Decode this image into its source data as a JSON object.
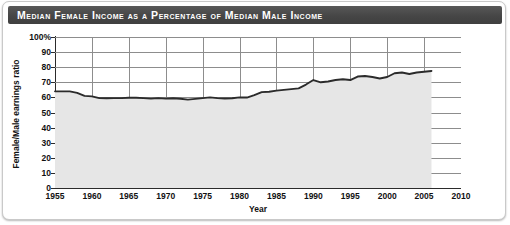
{
  "header": {
    "title": "Median Female Income as a Percentage of Median Male Income"
  },
  "chart_data": {
    "type": "area",
    "title": "Median Female Income as a Percentage of Median Male Income",
    "xlabel": "Year",
    "ylabel": "Female/Male earnings ratio",
    "xlim": [
      1955,
      2010
    ],
    "ylim": [
      0,
      100
    ],
    "grid": true,
    "legend": null,
    "xticks": [
      1955,
      1960,
      1965,
      1970,
      1975,
      1980,
      1985,
      1990,
      1995,
      2000,
      2005,
      2010
    ],
    "xtick_labels": [
      "1955",
      "1960",
      "1965",
      "1970",
      "1975",
      "1980",
      "1985",
      "1990",
      "1995",
      "2000",
      "2005",
      "2010"
    ],
    "yticks": [
      0,
      10,
      20,
      30,
      40,
      50,
      60,
      70,
      80,
      90,
      100
    ],
    "ytick_labels": [
      "0",
      "10",
      "20",
      "30",
      "40",
      "50",
      "60",
      "70",
      "80",
      "90",
      "100%"
    ],
    "line_color": "#2b2b2b",
    "fill_color": "#e6e6e6",
    "grid_color": "#8d8d8d",
    "series_name": "Female/Male earnings ratio",
    "x": [
      1955,
      1956,
      1957,
      1958,
      1959,
      1960,
      1961,
      1962,
      1963,
      1964,
      1965,
      1966,
      1967,
      1968,
      1969,
      1970,
      1971,
      1972,
      1973,
      1974,
      1975,
      1976,
      1977,
      1978,
      1979,
      1980,
      1981,
      1982,
      1983,
      1984,
      1985,
      1986,
      1987,
      1988,
      1989,
      1990,
      1991,
      1992,
      1993,
      1994,
      1995,
      1996,
      1997,
      1998,
      1999,
      2000,
      2001,
      2002,
      2003,
      2004,
      2005,
      2006
    ],
    "values": [
      64,
      64,
      64,
      63,
      61,
      60.7,
      59.5,
      59.4,
      59.5,
      59.5,
      59.8,
      59.8,
      59.5,
      59.2,
      59.5,
      59.2,
      59.4,
      59.1,
      58.5,
      59,
      59.5,
      60,
      59.5,
      59.3,
      59.4,
      60,
      59.9,
      61.5,
      63.5,
      63.7,
      64.5,
      65,
      65.5,
      66,
      68.5,
      71.5,
      70,
      70.5,
      71.5,
      72,
      71.5,
      73.8,
      74.2,
      73.5,
      72.5,
      73.5,
      76,
      76.5,
      75.5,
      76.5,
      77,
      77.5
    ]
  }
}
